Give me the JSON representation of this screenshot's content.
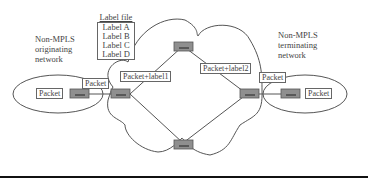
{
  "diagram": {
    "left_network_label": [
      "Non-MPLS",
      "originating",
      "network"
    ],
    "right_network_label": [
      "Non-MPLS",
      "terminating",
      "network"
    ],
    "label_file": {
      "title": "Label file",
      "entries": [
        "Label A",
        "Label B",
        "Label C",
        "Label D"
      ]
    },
    "packet_boxes": {
      "left_host": "Packet",
      "left_link": "Packet",
      "label1": "Packet+label1",
      "label2": "Packet+label2",
      "right_link": "Packet",
      "right_host": "Packet"
    },
    "colors": {
      "router_fill": "#8f8f8f",
      "line": "#555555",
      "rule": "#111111"
    }
  }
}
